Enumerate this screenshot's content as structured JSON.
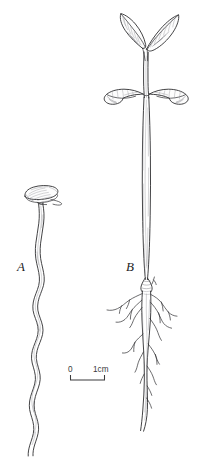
{
  "figure": {
    "background_color": "#ffffff",
    "ink_color": "#2e2e30",
    "hatch_color": "#8d8d92",
    "width": 205,
    "height": 460
  },
  "panels": [
    {
      "id": "A",
      "label": "A",
      "caption": "Germinating seed with elongated wavy radicle",
      "parts": [
        {
          "name": "seed-coat",
          "label": "seed"
        },
        {
          "name": "radicle",
          "label": "radicle"
        }
      ]
    },
    {
      "id": "B",
      "label": "B",
      "caption": "Established seedling with cotyledons, true leaves and branched taproot",
      "parts": [
        {
          "name": "true-leaf-left",
          "label": "true leaf"
        },
        {
          "name": "true-leaf-right",
          "label": "true leaf"
        },
        {
          "name": "cotyledon-left",
          "label": "cotyledon"
        },
        {
          "name": "cotyledon-right",
          "label": "cotyledon"
        },
        {
          "name": "hypocotyl",
          "label": "hypocotyl"
        },
        {
          "name": "taproot",
          "label": "taproot"
        },
        {
          "name": "lateral-roots",
          "label": "lateral roots"
        }
      ]
    }
  ],
  "scale_bar": {
    "start_label": "0",
    "end_label": "1cm",
    "length_px": 34,
    "units": "cm",
    "value": 1
  }
}
